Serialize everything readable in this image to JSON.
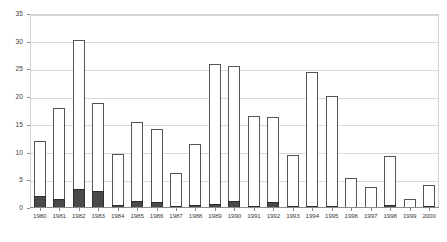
{
  "chart_data": {
    "type": "bar",
    "subtype": "stacked",
    "title": "",
    "xlabel": "",
    "ylabel": "",
    "ylim": [
      0,
      35
    ],
    "yticks": [
      0,
      5,
      10,
      15,
      20,
      25,
      30,
      35
    ],
    "grid": true,
    "legend": "none",
    "categories": [
      "1980",
      "1981",
      "1982",
      "1983",
      "1984",
      "1985",
      "1986",
      "1987",
      "1988",
      "1989",
      "1990",
      "1991",
      "1992",
      "1993",
      "1994",
      "1995",
      "1996",
      "1997",
      "1998",
      "1999",
      "2000"
    ],
    "series": [
      {
        "name": "lower-segment",
        "color": "#4a4a4a",
        "values": [
          2.2,
          1.6,
          3.5,
          3.0,
          0.5,
          1.2,
          1.0,
          0.2,
          0.6,
          0.8,
          1.2,
          0.4,
          1.0,
          0.2,
          0.3,
          0.3,
          0.0,
          0.0,
          0.5,
          0.0,
          0.3
        ]
      },
      {
        "name": "upper-segment",
        "color": "#ffffff",
        "values": [
          9.9,
          16.5,
          26.8,
          16.0,
          9.3,
          14.3,
          13.3,
          5.8,
          10.9,
          25.2,
          24.5,
          16.2,
          15.5,
          9.2,
          24.0,
          19.8,
          5.4,
          3.8,
          8.8,
          1.6,
          3.7
        ]
      }
    ],
    "totals": [
      12.1,
      18.1,
      30.3,
      19.0,
      9.8,
      15.5,
      14.3,
      6.0,
      11.5,
      26.0,
      25.7,
      16.6,
      16.5,
      9.4,
      24.3,
      20.1,
      5.4,
      3.8,
      9.3,
      1.6,
      4.0
    ]
  },
  "style": {
    "plot_border_color": "#d2d2d2",
    "gridline_color": "#d9d9d9",
    "axis_color": "#8c8c8c",
    "tick_label_color": "#3a3a3a",
    "bar_outline_color": "#555555",
    "background": "#ffffff"
  }
}
